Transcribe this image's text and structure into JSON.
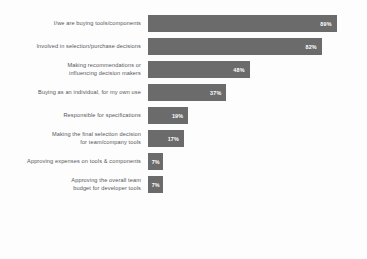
{
  "chart_data": {
    "type": "bar",
    "orientation": "horizontal",
    "title": "",
    "subtitle": "",
    "xlabel": "",
    "ylabel": "",
    "xlim": [
      0,
      100
    ],
    "grid": false,
    "legend": false,
    "value_suffix": "%",
    "categories": [
      "I/we are buying tools/components",
      "Involved in selection/purchase decisions",
      "Making recommendations or\ninfluencing decision makers",
      "Buying as an individual, for my own use",
      "Responsible for specifications",
      "Making the final selection decision\nfor team/company tools",
      "Approving expenses on tools & components",
      "Approving the overall team\nbudget for developer tools"
    ],
    "values": [
      89,
      82,
      48,
      37,
      19,
      17,
      7,
      7
    ],
    "value_labels": [
      "89%",
      "82%",
      "48%",
      "37%",
      "19%",
      "17%",
      "7%",
      "7%"
    ],
    "colors": {
      "bar": "#6b6b6b",
      "bar_label": "#ffffff",
      "category_label": "#55565a",
      "background": "#fdfdfd"
    }
  },
  "rows": [
    {
      "label": "I/we are buying tools/components",
      "value": 89,
      "value_label": "89%"
    },
    {
      "label": "Involved in selection/purchase decisions",
      "value": 82,
      "value_label": "82%"
    },
    {
      "label": "Making recommendations or\ninfluencing decision makers",
      "value": 48,
      "value_label": "48%"
    },
    {
      "label": "Buying as an individual, for my own use",
      "value": 37,
      "value_label": "37%"
    },
    {
      "label": "Responsible for specifications",
      "value": 19,
      "value_label": "19%"
    },
    {
      "label": "Making the final selection decision\nfor team/company tools",
      "value": 17,
      "value_label": "17%"
    },
    {
      "label": "Approving expenses on tools & components",
      "value": 7,
      "value_label": "7%"
    },
    {
      "label": "Approving the overall team\nbudget for developer tools",
      "value": 7,
      "value_label": "7%"
    }
  ]
}
